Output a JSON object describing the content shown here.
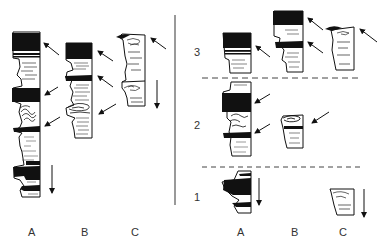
{
  "figure": {
    "left_panel": {
      "column_labels": [
        "A",
        "B",
        "C"
      ]
    },
    "right_panel": {
      "column_labels": [
        "A",
        "B",
        "C"
      ],
      "row_labels": [
        "3",
        "2",
        "1"
      ]
    },
    "colors": {
      "ink": "#111111",
      "background": "#ffffff",
      "label": "#333333",
      "divider": "#555555"
    }
  }
}
